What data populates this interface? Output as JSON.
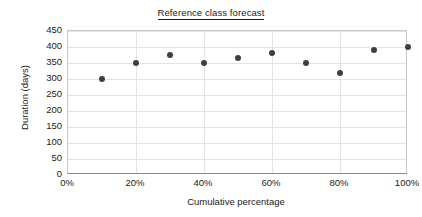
{
  "chart_data": {
    "type": "scatter",
    "title": "Reference class forecast",
    "xlabel": "Cumulative percentage",
    "ylabel": "Duration (days)",
    "x": [
      10,
      20,
      30,
      40,
      50,
      60,
      70,
      80,
      90,
      100
    ],
    "values": [
      300,
      350,
      375,
      350,
      365,
      380,
      350,
      320,
      390,
      400
    ],
    "series": [
      {
        "name": "Duration",
        "values": [
          300,
          350,
          375,
          350,
          365,
          380,
          350,
          320,
          390,
          400
        ]
      }
    ],
    "xlim": [
      0,
      100
    ],
    "ylim": [
      0,
      450
    ],
    "x_ticks": [
      0,
      20,
      40,
      60,
      80,
      100
    ],
    "x_tick_labels": [
      "0%",
      "20%",
      "40%",
      "60%",
      "80%",
      "100%"
    ],
    "y_ticks": [
      0,
      50,
      100,
      150,
      200,
      250,
      300,
      350,
      400,
      450
    ],
    "y_tick_labels": [
      "0",
      "50",
      "100",
      "150",
      "200",
      "250",
      "300",
      "350",
      "400",
      "450"
    ],
    "grid": true,
    "legend": null,
    "marker_color": "#3f3f3f",
    "grid_color": "#e3e3e3",
    "axis_color": "#8a8a8a",
    "background": "#ffffff"
  }
}
